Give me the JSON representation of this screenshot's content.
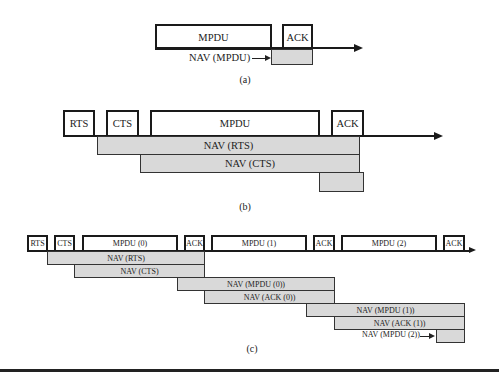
{
  "panel_a": {
    "caption": "(a)",
    "frames": {
      "mpdu": "MPDU",
      "ack": "ACK"
    },
    "nav": {
      "mpdu_label": "NAV (MPDU)"
    }
  },
  "panel_b": {
    "caption": "(b)",
    "frames": {
      "rts": "RTS",
      "cts": "CTS",
      "mpdu": "MPDU",
      "ack": "ACK"
    },
    "nav": {
      "rts": "NAV (RTS)",
      "cts": "NAV (CTS)",
      "ack_unlabeled": ""
    }
  },
  "panel_c": {
    "caption": "(c)",
    "frames": {
      "rts": "RTS",
      "cts": "CTS",
      "mpdu0": "MPDU (0)",
      "ack0": "ACK",
      "mpdu1": "MPDU (1)",
      "ack1": "ACK",
      "mpdu2": "MPDU (2)",
      "ack2": "ACK"
    },
    "nav": {
      "rts": "NAV (RTS)",
      "cts": "NAV (CTS)",
      "mpdu0": "NAV (MPDU (0))",
      "ack0": "NAV (ACK (0))",
      "mpdu1": "NAV (MPDU (1))",
      "ack1": "NAV (ACK (1))",
      "mpdu2": "NAV (MPDU (2))"
    }
  },
  "colors": {
    "nav_fill": "#d9d9d9",
    "frame_border": "#1a1a1a"
  }
}
